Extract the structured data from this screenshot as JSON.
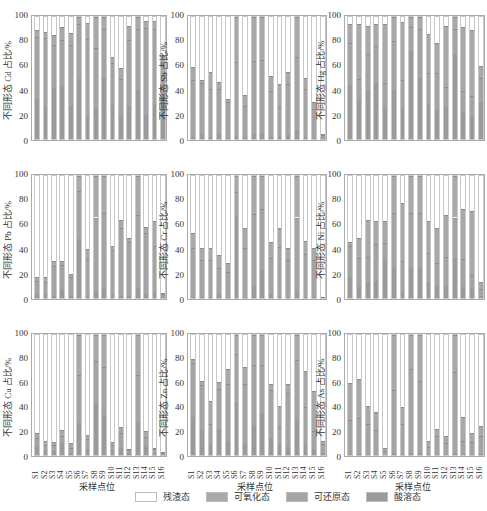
{
  "chart_data": [
    {
      "type": "bar",
      "stacked": true,
      "title": "",
      "element": "Cd",
      "ylabel": "不同形态 Cd 占比/%",
      "xlabel": "",
      "ylim": [
        0,
        100
      ],
      "yticks": [
        0,
        20,
        40,
        60,
        80,
        100
      ],
      "categories": [
        "S1",
        "S2",
        "S3",
        "S4",
        "S5",
        "S6",
        "S7",
        "S8",
        "S9",
        "S10",
        "S11",
        "S12",
        "S13",
        "S14",
        "S15",
        "S16"
      ],
      "series": [
        {
          "name": "酸溶态",
          "values": [
            33,
            27,
            42,
            43,
            27,
            49,
            19,
            25,
            50,
            28,
            19,
            27,
            40,
            20,
            29,
            35
          ]
        },
        {
          "name": "可还原态",
          "values": [
            51,
            56,
            35,
            38,
            50,
            45,
            63,
            50,
            40,
            34,
            30,
            54,
            50,
            71,
            61,
            25
          ]
        },
        {
          "name": "可氧化态",
          "values": [
            5,
            5,
            8,
            11,
            10,
            6,
            13,
            25,
            10,
            5,
            9,
            12,
            10,
            6,
            7,
            8
          ]
        },
        {
          "name": "残渣态",
          "values": [
            11,
            12,
            15,
            8,
            13,
            0,
            5,
            0,
            0,
            33,
            42,
            7,
            0,
            3,
            3,
            32
          ]
        }
      ]
    },
    {
      "type": "bar",
      "stacked": true,
      "element": "Sb",
      "ylabel": "不同形态 Sb 占比/%",
      "ylim": [
        0,
        100
      ],
      "yticks": [
        0,
        20,
        40,
        60,
        80,
        100
      ],
      "categories": [
        "S1",
        "S2",
        "S3",
        "S4",
        "S5",
        "S6",
        "S7",
        "S8",
        "S9",
        "S10",
        "S11",
        "S12",
        "S13",
        "S14",
        "S15",
        "S16"
      ],
      "series": [
        {
          "name": "酸溶态",
          "values": [
            2,
            3,
            2,
            4,
            1,
            3,
            2,
            4,
            5,
            2,
            3,
            3,
            7,
            2,
            1,
            2
          ]
        },
        {
          "name": "可还原态",
          "values": [
            46,
            43,
            39,
            37,
            29,
            60,
            25,
            60,
            60,
            37,
            23,
            42,
            60,
            39,
            24,
            1
          ]
        },
        {
          "name": "可氧化态",
          "values": [
            11,
            2,
            14,
            6,
            3,
            37,
            9,
            36,
            35,
            13,
            19,
            10,
            33,
            9,
            5,
            0
          ]
        },
        {
          "name": "残渣态",
          "values": [
            41,
            52,
            45,
            53,
            67,
            0,
            64,
            0,
            0,
            48,
            55,
            45,
            0,
            50,
            70,
            97
          ]
        }
      ]
    },
    {
      "type": "bar",
      "stacked": true,
      "element": "Hg",
      "ylabel": "不同形态 Hg 占比/%",
      "ylim": [
        0,
        100
      ],
      "yticks": [
        0,
        20,
        40,
        60,
        80,
        100
      ],
      "categories": [
        "S1",
        "S2",
        "S3",
        "S4",
        "S5",
        "S6",
        "S7",
        "S8",
        "S9",
        "S10",
        "S11",
        "S12",
        "S13",
        "S14",
        "S15",
        "S16"
      ],
      "series": [
        {
          "name": "酸溶态",
          "values": [
            44,
            32,
            40,
            46,
            26,
            40,
            26,
            72,
            50,
            28,
            24,
            26,
            70,
            22,
            18,
            30
          ]
        },
        {
          "name": "可还原态",
          "values": [
            35,
            17,
            30,
            30,
            20,
            40,
            22,
            20,
            40,
            26,
            30,
            17,
            20,
            17,
            17,
            20
          ]
        },
        {
          "name": "可氧化态",
          "values": [
            15,
            45,
            23,
            18,
            48,
            20,
            48,
            8,
            10,
            32,
            25,
            50,
            10,
            53,
            54,
            10
          ]
        },
        {
          "name": "残渣态",
          "values": [
            6,
            6,
            7,
            6,
            6,
            0,
            4,
            0,
            0,
            14,
            21,
            7,
            0,
            8,
            11,
            40
          ]
        }
      ]
    },
    {
      "type": "bar",
      "stacked": true,
      "element": "Pb",
      "ylabel": "不同形态 Pb 占比/%",
      "ylim": [
        0,
        100
      ],
      "yticks": [
        0,
        20,
        40,
        60,
        80,
        100
      ],
      "categories": [
        "S1",
        "S2",
        "S3",
        "S4",
        "S5",
        "S6",
        "S7",
        "S8",
        "S9",
        "S10",
        "S11",
        "S12",
        "S13",
        "S14",
        "S15",
        "S16"
      ],
      "series": [
        {
          "name": "酸溶态",
          "values": [
            3,
            3,
            2,
            7,
            2,
            48,
            2,
            6,
            8,
            3,
            2,
            2,
            8,
            3,
            4,
            1
          ]
        },
        {
          "name": "可还原态",
          "values": [
            11,
            10,
            24,
            20,
            15,
            40,
            30,
            60,
            62,
            36,
            55,
            44,
            60,
            50,
            39,
            2
          ]
        },
        {
          "name": "可氧化态",
          "values": [
            3,
            4,
            4,
            3,
            3,
            12,
            8,
            34,
            30,
            4,
            7,
            3,
            32,
            5,
            20,
            1
          ]
        },
        {
          "name": "残渣态",
          "values": [
            83,
            83,
            70,
            70,
            80,
            0,
            60,
            0,
            0,
            57,
            36,
            51,
            0,
            42,
            37,
            96
          ]
        }
      ]
    },
    {
      "type": "bar",
      "stacked": true,
      "element": "Cr",
      "ylabel": "不同形态 Cr 占比/%",
      "ylim": [
        0,
        100
      ],
      "yticks": [
        0,
        20,
        40,
        60,
        80,
        100
      ],
      "categories": [
        "S1",
        "S2",
        "S3",
        "S4",
        "S5",
        "S6",
        "S7",
        "S8",
        "S9",
        "S10",
        "S11",
        "S12",
        "S13",
        "S14",
        "S15",
        "S16"
      ],
      "series": [
        {
          "name": "酸溶态",
          "values": [
            1,
            1,
            1,
            3,
            1,
            67,
            1,
            9,
            23,
            3,
            2,
            1,
            6,
            1,
            1,
            0
          ]
        },
        {
          "name": "可还原态",
          "values": [
            40,
            30,
            30,
            22,
            20,
            20,
            40,
            60,
            50,
            30,
            40,
            30,
            60,
            35,
            30,
            0
          ]
        },
        {
          "name": "可氧化态",
          "values": [
            12,
            10,
            10,
            10,
            8,
            13,
            16,
            31,
            27,
            13,
            15,
            10,
            34,
            11,
            10,
            1
          ]
        },
        {
          "name": "残渣态",
          "values": [
            47,
            59,
            59,
            65,
            71,
            0,
            43,
            0,
            0,
            54,
            43,
            59,
            0,
            53,
            59,
            99
          ]
        }
      ]
    },
    {
      "type": "bar",
      "stacked": true,
      "element": "Ni",
      "ylabel": "不同形态 Ni 占比/%",
      "ylim": [
        0,
        100
      ],
      "yticks": [
        0,
        20,
        40,
        60,
        80,
        100
      ],
      "categories": [
        "S1",
        "S2",
        "S3",
        "S4",
        "S5",
        "S6",
        "S7",
        "S8",
        "S9",
        "S10",
        "S11",
        "S12",
        "S13",
        "S14",
        "S15",
        "S16"
      ],
      "series": [
        {
          "name": "酸溶态",
          "values": [
            17,
            9,
            13,
            14,
            31,
            25,
            6,
            25,
            25,
            13,
            10,
            9,
            33,
            9,
            7,
            2
          ]
        },
        {
          "name": "可还原态",
          "values": [
            26,
            24,
            21,
            30,
            14,
            45,
            24,
            45,
            45,
            24,
            19,
            25,
            33,
            23,
            12,
            5
          ]
        },
        {
          "name": "可氧化态",
          "values": [
            3,
            16,
            30,
            19,
            18,
            30,
            48,
            30,
            30,
            26,
            28,
            34,
            34,
            41,
            52,
            6
          ]
        },
        {
          "name": "残渣态",
          "values": [
            54,
            51,
            36,
            37,
            37,
            0,
            22,
            0,
            0,
            37,
            43,
            32,
            0,
            27,
            29,
            87
          ]
        }
      ]
    },
    {
      "type": "bar",
      "stacked": true,
      "element": "Cu",
      "ylabel": "不同形态 Cu 占比/%",
      "xlabel": "采样点位",
      "ylim": [
        0,
        100
      ],
      "yticks": [
        0,
        20,
        40,
        60,
        80,
        100
      ],
      "categories": [
        "S1",
        "S2",
        "S3",
        "S4",
        "S5",
        "S6",
        "S7",
        "S8",
        "S9",
        "S10",
        "S11",
        "S12",
        "S13",
        "S14",
        "S15",
        "S16"
      ],
      "series": [
        {
          "name": "酸溶态",
          "values": [
            7,
            4,
            3,
            10,
            2,
            27,
            5,
            43,
            33,
            4,
            6,
            2,
            27,
            7,
            2,
            1
          ]
        },
        {
          "name": "可还原态",
          "values": [
            7,
            4,
            5,
            6,
            4,
            40,
            8,
            35,
            40,
            4,
            12,
            2,
            40,
            8,
            3,
            1
          ]
        },
        {
          "name": "可氧化态",
          "values": [
            4,
            4,
            3,
            5,
            4,
            33,
            4,
            22,
            27,
            3,
            5,
            1,
            33,
            5,
            1,
            0
          ]
        },
        {
          "name": "残渣态",
          "values": [
            82,
            88,
            89,
            79,
            90,
            0,
            83,
            0,
            0,
            89,
            77,
            95,
            0,
            80,
            94,
            98
          ]
        }
      ]
    },
    {
      "type": "bar",
      "stacked": true,
      "element": "Zn",
      "ylabel": "不同形态 Zn 占比/%",
      "xlabel": "采样点位",
      "ylim": [
        0,
        100
      ],
      "yticks": [
        0,
        20,
        40,
        60,
        80,
        100
      ],
      "categories": [
        "S1",
        "S2",
        "S3",
        "S4",
        "S5",
        "S6",
        "S7",
        "S8",
        "S9",
        "S10",
        "S11",
        "S12",
        "S13",
        "S14",
        "S15",
        "S16"
      ],
      "series": [
        {
          "name": "酸溶态",
          "values": [
            32,
            20,
            8,
            22,
            12,
            44,
            9,
            25,
            35,
            14,
            9,
            7,
            29,
            10,
            5,
            2
          ]
        },
        {
          "name": "可还原态",
          "values": [
            45,
            38,
            18,
            33,
            47,
            40,
            50,
            50,
            40,
            40,
            14,
            45,
            50,
            30,
            15,
            7
          ]
        },
        {
          "name": "可氧化态",
          "values": [
            3,
            4,
            19,
            6,
            13,
            16,
            14,
            25,
            25,
            5,
            18,
            7,
            21,
            30,
            33,
            3
          ]
        },
        {
          "name": "残渣态",
          "values": [
            20,
            38,
            55,
            39,
            28,
            0,
            27,
            0,
            0,
            41,
            59,
            41,
            0,
            30,
            47,
            88
          ]
        }
      ]
    },
    {
      "type": "bar",
      "stacked": true,
      "element": "As",
      "ylabel": "不同形态 As 占比/%",
      "xlabel": "采样点位",
      "ylim": [
        0,
        100
      ],
      "yticks": [
        0,
        20,
        40,
        60,
        80,
        100
      ],
      "categories": [
        "S1",
        "S2",
        "S3",
        "S4",
        "S5",
        "S6",
        "S7",
        "S8",
        "S9",
        "S10",
        "S11",
        "S12",
        "S13",
        "S14",
        "S15",
        "S16"
      ],
      "series": [
        {
          "name": "酸溶态",
          "values": [
            1,
            1,
            1,
            1,
            0,
            2,
            1,
            2,
            2,
            1,
            1,
            1,
            2,
            1,
            1,
            1
          ]
        },
        {
          "name": "可还原态",
          "values": [
            28,
            30,
            25,
            20,
            3,
            52,
            25,
            70,
            60,
            6,
            15,
            9,
            67,
            11,
            10,
            15
          ]
        },
        {
          "name": "可氧化态",
          "values": [
            31,
            32,
            15,
            15,
            3,
            46,
            14,
            28,
            38,
            5,
            6,
            6,
            31,
            20,
            7,
            8
          ]
        },
        {
          "name": "残渣态",
          "values": [
            40,
            37,
            59,
            64,
            94,
            0,
            60,
            0,
            0,
            88,
            78,
            84,
            0,
            68,
            82,
            76
          ]
        }
      ]
    }
  ],
  "legend": [
    {
      "label": "残渣态",
      "color": "#ffffff"
    },
    {
      "label": "可氧化态",
      "color": "#a9a9a9"
    },
    {
      "label": "可还原态",
      "color": "#a4a4a4"
    },
    {
      "label": "酸溶态",
      "color": "#9a9a9a"
    }
  ],
  "xlabel": "采样点位"
}
